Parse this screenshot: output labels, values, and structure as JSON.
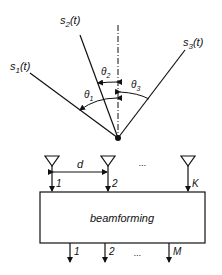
{
  "signals": {
    "s1": {
      "base": "s",
      "sub": "1",
      "arg": "(t)"
    },
    "s2": {
      "base": "s",
      "sub": "2",
      "arg": "(t)"
    },
    "s3": {
      "base": "s",
      "sub": "3",
      "arg": "(t)"
    }
  },
  "angles": {
    "theta1": {
      "base": "θ",
      "sub": "1"
    },
    "theta2": {
      "base": "θ",
      "sub": "2"
    },
    "theta3": {
      "base": "θ",
      "sub": "3"
    }
  },
  "array": {
    "spacing_label": "d",
    "ellipsis": "...",
    "input_labels": [
      "1",
      "2",
      "K"
    ]
  },
  "block": {
    "label": "beamforming"
  },
  "outputs": {
    "labels": [
      "1",
      "2",
      "M"
    ],
    "ellipsis": "..."
  }
}
